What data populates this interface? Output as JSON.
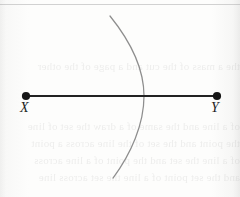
{
  "figure": {
    "name": "compass-arc-on-segment-xy",
    "background_color": "#fbfbfa",
    "segment_color": "#222222",
    "arc_color": "#8e8e8e",
    "dot_color": "#161616",
    "label_color": "#1c1c1c"
  },
  "points": [
    {
      "id": "x",
      "label": "X",
      "cx": 26,
      "cy": 96,
      "r": 4.1,
      "label_x": 20,
      "label_y": 101
    },
    {
      "id": "y",
      "label": "Y",
      "cx": 217,
      "cy": 96,
      "r": 4.1,
      "label_x": 211,
      "label_y": 101
    }
  ],
  "segment": {
    "name": "segment-xy",
    "x1": 26,
    "y1": 96,
    "x2": 217,
    "y2": 96,
    "stroke_width": 2.1
  },
  "arc": {
    "name": "compass-arc",
    "path": "M 110 16 C 131 42, 144 68, 144 96 C 144 124, 131 154, 113 178",
    "stroke_width": 1.25,
    "top_x": 110,
    "top_y": 16,
    "bottom_x": 113,
    "bottom_y": 178,
    "intersection_x": 144,
    "intersection_y": 96
  },
  "scan_artifacts": {
    "top_rule_y": 4,
    "top_rule_color": "#c9c9c9",
    "bleed_text_top": "the a mass of the cut and a page of the other",
    "bleed_text_bottom": "of a line and the same of a draw the set of line\nthe point and the set of the line across a point\nof a line the set and the point of a line across\nand the set point of a line the set across line"
  }
}
